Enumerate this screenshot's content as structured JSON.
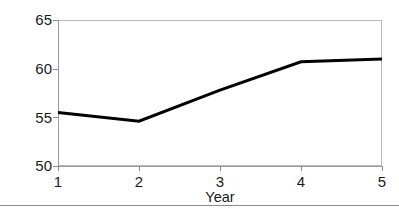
{
  "chart_data": {
    "type": "line",
    "title": "",
    "subtitle": "",
    "xlabel": "Year",
    "ylabel": "Productivity ($/hr)",
    "x": [
      1,
      2,
      3,
      4,
      5
    ],
    "xtick_labels": [
      "1",
      "2",
      "3",
      "4",
      "5"
    ],
    "ytick_labels": [
      "50",
      "55",
      "60",
      "65"
    ],
    "ytick_values": [
      50,
      55,
      60,
      65
    ],
    "xlim": [
      1,
      5
    ],
    "ylim": [
      50,
      65
    ],
    "grid": false,
    "legend": null,
    "legend_position": "none",
    "annotations": [],
    "series": [
      {
        "name": "Productivity",
        "values": [
          55.5,
          54.6,
          57.8,
          60.7,
          61.0
        ],
        "color": "#000000",
        "line_width": 3,
        "markers": false
      }
    ]
  },
  "figure": {
    "axis_color": "#b9b9b9",
    "tick_color": "#8d8d8d",
    "text_color": "#1a1a1a",
    "background": "#ffffff"
  }
}
